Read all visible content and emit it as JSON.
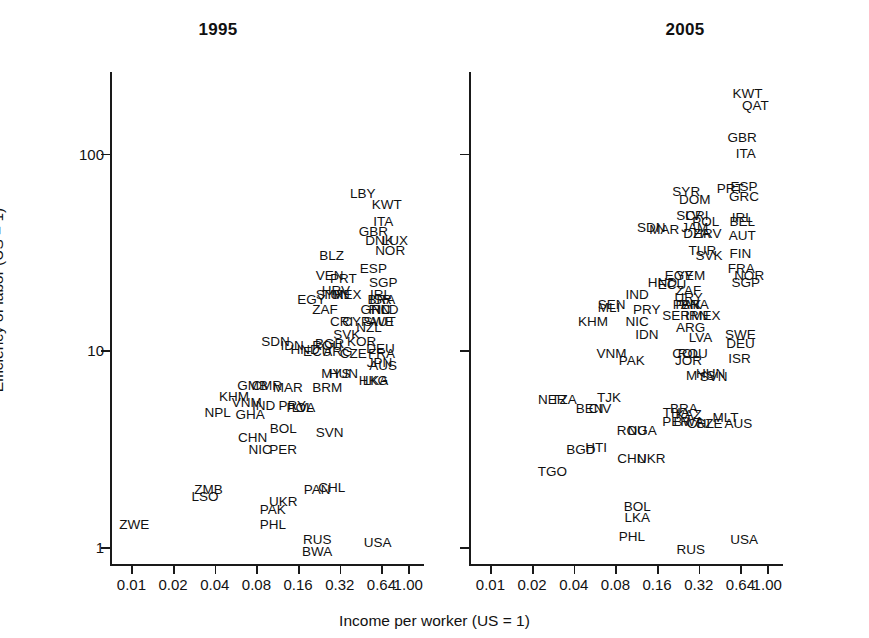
{
  "figure": {
    "xlabel": "Income per worker (US = 1)",
    "ylabel": "Efficiency of labor (US = 1)",
    "panels": [
      {
        "id": "1995",
        "title": "1995"
      },
      {
        "id": "2005",
        "title": "2005"
      }
    ]
  },
  "axes": {
    "x_ticks": [
      "0.01",
      "0.02",
      "0.04",
      "0.08",
      "0.16",
      "0.32",
      "0.64",
      "1.00"
    ],
    "x_values": [
      0.01,
      0.02,
      0.04,
      0.08,
      0.16,
      0.32,
      0.64,
      1.0
    ],
    "y_ticks": [
      "1",
      "10",
      "100"
    ],
    "y_values": [
      1,
      10,
      100
    ],
    "x_scale": "log",
    "y_scale": "log",
    "xlim": [
      0.007,
      1.3
    ],
    "ylim": [
      0.8,
      260
    ]
  },
  "chart_data": {
    "type": "scatter",
    "xlabel": "Income per worker (US = 1)",
    "ylabel": "Efficiency of labor (US = 1)",
    "x_scale": "log",
    "y_scale": "log",
    "xlim": [
      0.007,
      1.3
    ],
    "ylim": [
      0.8,
      260
    ],
    "grid": false,
    "legend": "none",
    "point_style": "text-label-only (ISO3 country codes, no markers)",
    "panels": [
      {
        "name": "1995",
        "points": [
          {
            "label": "LBY",
            "x": 0.47,
            "y": 62
          },
          {
            "label": "KWT",
            "x": 0.7,
            "y": 55
          },
          {
            "label": "ITA",
            "x": 0.66,
            "y": 45
          },
          {
            "label": "GBR",
            "x": 0.56,
            "y": 40
          },
          {
            "label": "DNK",
            "x": 0.62,
            "y": 36
          },
          {
            "label": "LUX",
            "x": 0.8,
            "y": 36
          },
          {
            "label": "NOR",
            "x": 0.74,
            "y": 32
          },
          {
            "label": "BLZ",
            "x": 0.28,
            "y": 30
          },
          {
            "label": "ESP",
            "x": 0.56,
            "y": 26
          },
          {
            "label": "VEN",
            "x": 0.27,
            "y": 24
          },
          {
            "label": "PRT",
            "x": 0.34,
            "y": 23
          },
          {
            "label": "SGP",
            "x": 0.66,
            "y": 22
          },
          {
            "label": "HRV",
            "x": 0.3,
            "y": 20
          },
          {
            "label": "TUN",
            "x": 0.3,
            "y": 19
          },
          {
            "label": "MEX",
            "x": 0.36,
            "y": 19
          },
          {
            "label": "SYR",
            "x": 0.27,
            "y": 19
          },
          {
            "label": "EGY",
            "x": 0.2,
            "y": 18
          },
          {
            "label": "IRL",
            "x": 0.63,
            "y": 19
          },
          {
            "label": "ISR",
            "x": 0.63,
            "y": 18
          },
          {
            "label": "BRA",
            "x": 0.64,
            "y": 18
          },
          {
            "label": "ZAF",
            "x": 0.25,
            "y": 16
          },
          {
            "label": "GRC",
            "x": 0.58,
            "y": 16
          },
          {
            "label": "FIN",
            "x": 0.62,
            "y": 16
          },
          {
            "label": "NLD",
            "x": 0.68,
            "y": 16
          },
          {
            "label": "SWE",
            "x": 0.61,
            "y": 14
          },
          {
            "label": "AUT",
            "x": 0.65,
            "y": 14
          },
          {
            "label": "CRI",
            "x": 0.33,
            "y": 14
          },
          {
            "label": "CYP",
            "x": 0.42,
            "y": 14
          },
          {
            "label": "NZL",
            "x": 0.52,
            "y": 13
          },
          {
            "label": "SVK",
            "x": 0.36,
            "y": 12
          },
          {
            "label": "KOR",
            "x": 0.46,
            "y": 11
          },
          {
            "label": "SDN",
            "x": 0.11,
            "y": 11
          },
          {
            "label": "IDN",
            "x": 0.145,
            "y": 10.5
          },
          {
            "label": "HND",
            "x": 0.18,
            "y": 10
          },
          {
            "label": "ROU",
            "x": 0.26,
            "y": 10.5
          },
          {
            "label": "BGR",
            "x": 0.27,
            "y": 10.8
          },
          {
            "label": "ECU",
            "x": 0.22,
            "y": 9.8
          },
          {
            "label": "ARG",
            "x": 0.31,
            "y": 9.8
          },
          {
            "label": "CZE",
            "x": 0.4,
            "y": 9.6
          },
          {
            "label": "DEU",
            "x": 0.63,
            "y": 10.2
          },
          {
            "label": "FRA",
            "x": 0.64,
            "y": 9.6
          },
          {
            "label": "JPN",
            "x": 0.62,
            "y": 8.6
          },
          {
            "label": "AUS",
            "x": 0.66,
            "y": 8.3
          },
          {
            "label": "MYS",
            "x": 0.3,
            "y": 7.6
          },
          {
            "label": "HUN",
            "x": 0.34,
            "y": 7.6
          },
          {
            "label": "HKG",
            "x": 0.56,
            "y": 7.0
          },
          {
            "label": "LKA",
            "x": 0.58,
            "y": 7.0
          },
          {
            "label": "GMB",
            "x": 0.075,
            "y": 6.6
          },
          {
            "label": "CMR",
            "x": 0.095,
            "y": 6.6
          },
          {
            "label": "MAR",
            "x": 0.135,
            "y": 6.4
          },
          {
            "label": "BRM",
            "x": 0.26,
            "y": 6.4
          },
          {
            "label": "KHM",
            "x": 0.055,
            "y": 5.8
          },
          {
            "label": "VNM",
            "x": 0.068,
            "y": 5.4
          },
          {
            "label": "IND",
            "x": 0.09,
            "y": 5.2
          },
          {
            "label": "PRY",
            "x": 0.145,
            "y": 5.2
          },
          {
            "label": "POL",
            "x": 0.165,
            "y": 5.1
          },
          {
            "label": "LVA",
            "x": 0.175,
            "y": 5.1
          },
          {
            "label": "NPL",
            "x": 0.042,
            "y": 4.8
          },
          {
            "label": "GHA",
            "x": 0.072,
            "y": 4.7
          },
          {
            "label": "BOL",
            "x": 0.125,
            "y": 4.0
          },
          {
            "label": "CHN",
            "x": 0.075,
            "y": 3.6
          },
          {
            "label": "SVN",
            "x": 0.27,
            "y": 3.8
          },
          {
            "label": "NIC",
            "x": 0.085,
            "y": 3.1
          },
          {
            "label": "PER",
            "x": 0.125,
            "y": 3.1
          },
          {
            "label": "ZMB",
            "x": 0.036,
            "y": 1.95
          },
          {
            "label": "LSO",
            "x": 0.034,
            "y": 1.8
          },
          {
            "label": "PAN",
            "x": 0.22,
            "y": 1.95
          },
          {
            "label": "CHL",
            "x": 0.28,
            "y": 2.0
          },
          {
            "label": "UKR",
            "x": 0.125,
            "y": 1.7
          },
          {
            "label": "PAK",
            "x": 0.105,
            "y": 1.55
          },
          {
            "label": "PHL",
            "x": 0.105,
            "y": 1.3
          },
          {
            "label": "ZWE",
            "x": 0.0105,
            "y": 1.3
          },
          {
            "label": "RUS",
            "x": 0.22,
            "y": 1.08
          },
          {
            "label": "BWA",
            "x": 0.22,
            "y": 0.94
          },
          {
            "label": "USA",
            "x": 0.6,
            "y": 1.05
          }
        ]
      },
      {
        "name": "2005",
        "points": [
          {
            "label": "KWT",
            "x": 0.72,
            "y": 200
          },
          {
            "label": "QAT",
            "x": 0.82,
            "y": 175
          },
          {
            "label": "GBR",
            "x": 0.66,
            "y": 120
          },
          {
            "label": "ITA",
            "x": 0.7,
            "y": 100
          },
          {
            "label": "PRT",
            "x": 0.54,
            "y": 66
          },
          {
            "label": "ESP",
            "x": 0.68,
            "y": 68
          },
          {
            "label": "GRC",
            "x": 0.68,
            "y": 60
          },
          {
            "label": "SYR",
            "x": 0.26,
            "y": 64
          },
          {
            "label": "DOM",
            "x": 0.3,
            "y": 58
          },
          {
            "label": "SLV",
            "x": 0.27,
            "y": 48
          },
          {
            "label": "CRI",
            "x": 0.31,
            "y": 48
          },
          {
            "label": "POL",
            "x": 0.36,
            "y": 45
          },
          {
            "label": "IRL",
            "x": 0.66,
            "y": 47
          },
          {
            "label": "BEL",
            "x": 0.66,
            "y": 45
          },
          {
            "label": "SDN",
            "x": 0.145,
            "y": 42
          },
          {
            "label": "MAR",
            "x": 0.18,
            "y": 41
          },
          {
            "label": "JAM",
            "x": 0.3,
            "y": 42
          },
          {
            "label": "DZA",
            "x": 0.31,
            "y": 39
          },
          {
            "label": "HRV",
            "x": 0.37,
            "y": 39
          },
          {
            "label": "AUT",
            "x": 0.66,
            "y": 38
          },
          {
            "label": "TUR",
            "x": 0.34,
            "y": 32
          },
          {
            "label": "SVK",
            "x": 0.38,
            "y": 30
          },
          {
            "label": "FIN",
            "x": 0.64,
            "y": 31
          },
          {
            "label": "FRA",
            "x": 0.65,
            "y": 26
          },
          {
            "label": "NOR",
            "x": 0.74,
            "y": 24
          },
          {
            "label": "SGP",
            "x": 0.7,
            "y": 22
          },
          {
            "label": "EGY",
            "x": 0.23,
            "y": 24
          },
          {
            "label": "YEM",
            "x": 0.28,
            "y": 24
          },
          {
            "label": "HND",
            "x": 0.175,
            "y": 22
          },
          {
            "label": "ECU",
            "x": 0.205,
            "y": 21.5
          },
          {
            "label": "ZAF",
            "x": 0.27,
            "y": 20
          },
          {
            "label": "URY",
            "x": 0.27,
            "y": 18.5
          },
          {
            "label": "IND",
            "x": 0.115,
            "y": 19
          },
          {
            "label": "PAN",
            "x": 0.26,
            "y": 17
          },
          {
            "label": "PAK",
            "x": 0.27,
            "y": 17
          },
          {
            "label": "BRA",
            "x": 0.3,
            "y": 17
          },
          {
            "label": "SEN",
            "x": 0.075,
            "y": 17
          },
          {
            "label": "MLI",
            "x": 0.072,
            "y": 16.5
          },
          {
            "label": "PRY",
            "x": 0.135,
            "y": 16
          },
          {
            "label": "SER",
            "x": 0.22,
            "y": 15
          },
          {
            "label": "IRN",
            "x": 0.31,
            "y": 15
          },
          {
            "label": "MEX",
            "x": 0.36,
            "y": 15
          },
          {
            "label": "KHM",
            "x": 0.055,
            "y": 14
          },
          {
            "label": "NIC",
            "x": 0.115,
            "y": 14
          },
          {
            "label": "ARG",
            "x": 0.28,
            "y": 13
          },
          {
            "label": "IDN",
            "x": 0.135,
            "y": 12
          },
          {
            "label": "LVA",
            "x": 0.33,
            "y": 11.5
          },
          {
            "label": "SWE",
            "x": 0.64,
            "y": 12
          },
          {
            "label": "DEU",
            "x": 0.64,
            "y": 10.8
          },
          {
            "label": "VNM",
            "x": 0.075,
            "y": 9.6
          },
          {
            "label": "COL",
            "x": 0.26,
            "y": 9.6
          },
          {
            "label": "ROU",
            "x": 0.29,
            "y": 9.6
          },
          {
            "label": "JOR",
            "x": 0.27,
            "y": 8.8
          },
          {
            "label": "PAK",
            "x": 0.105,
            "y": 8.8
          },
          {
            "label": "ISR",
            "x": 0.63,
            "y": 9.0
          },
          {
            "label": "MYS",
            "x": 0.33,
            "y": 7.4
          },
          {
            "label": "HUN",
            "x": 0.39,
            "y": 7.6
          },
          {
            "label": "SVN",
            "x": 0.41,
            "y": 7.3
          },
          {
            "label": "NER",
            "x": 0.028,
            "y": 5.6
          },
          {
            "label": "TZA",
            "x": 0.034,
            "y": 5.6
          },
          {
            "label": "TJK",
            "x": 0.072,
            "y": 5.7
          },
          {
            "label": "BEN",
            "x": 0.052,
            "y": 5.0
          },
          {
            "label": "CIV",
            "x": 0.062,
            "y": 5.0
          },
          {
            "label": "THA",
            "x": 0.22,
            "y": 4.8
          },
          {
            "label": "KAZ",
            "x": 0.27,
            "y": 4.7
          },
          {
            "label": "BRA",
            "x": 0.25,
            "y": 5.0
          },
          {
            "label": "PER",
            "x": 0.22,
            "y": 4.3
          },
          {
            "label": "BWA",
            "x": 0.27,
            "y": 4.3
          },
          {
            "label": "CHL",
            "x": 0.33,
            "y": 4.2
          },
          {
            "label": "CZE",
            "x": 0.38,
            "y": 4.2
          },
          {
            "label": "MLT",
            "x": 0.5,
            "y": 4.5
          },
          {
            "label": "AUS",
            "x": 0.62,
            "y": 4.2
          },
          {
            "label": "ROU",
            "x": 0.105,
            "y": 3.9
          },
          {
            "label": "NGA",
            "x": 0.125,
            "y": 3.9
          },
          {
            "label": "BGD",
            "x": 0.045,
            "y": 3.1
          },
          {
            "label": "HTI",
            "x": 0.058,
            "y": 3.2
          },
          {
            "label": "CHN",
            "x": 0.105,
            "y": 2.8
          },
          {
            "label": "UKR",
            "x": 0.145,
            "y": 2.8
          },
          {
            "label": "TGO",
            "x": 0.028,
            "y": 2.4
          },
          {
            "label": "BOL",
            "x": 0.115,
            "y": 1.6
          },
          {
            "label": "LKA",
            "x": 0.115,
            "y": 1.4
          },
          {
            "label": "PHL",
            "x": 0.105,
            "y": 1.12
          },
          {
            "label": "RUS",
            "x": 0.28,
            "y": 0.97
          },
          {
            "label": "USA",
            "x": 0.68,
            "y": 1.08
          }
        ]
      }
    ]
  }
}
